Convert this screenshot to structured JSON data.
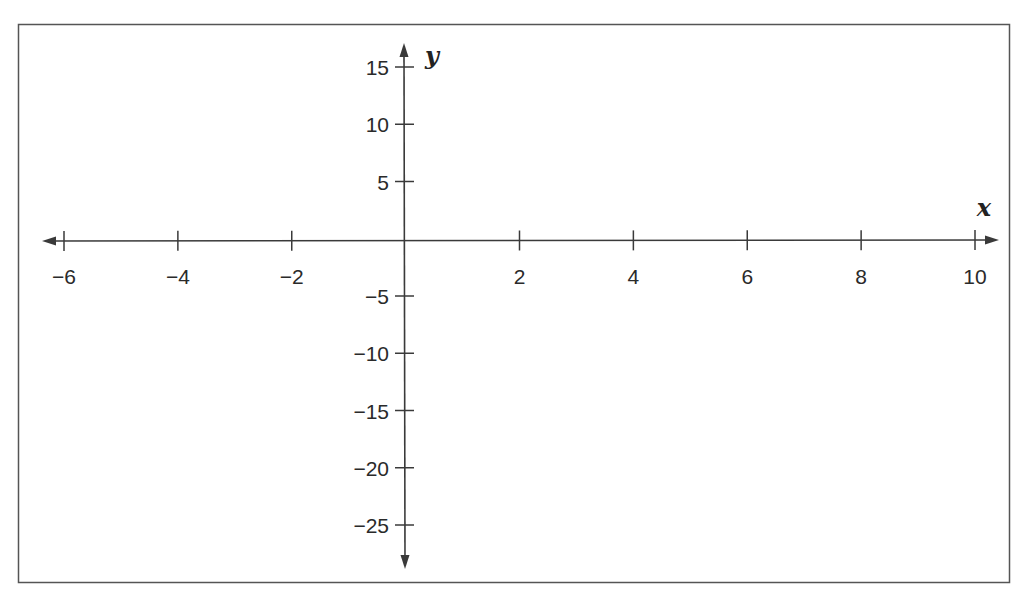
{
  "chart_data": {
    "type": "line",
    "title": "",
    "xlabel": "x",
    "ylabel": "y",
    "xlim": [
      -6,
      10
    ],
    "ylim": [
      -25,
      15
    ],
    "grid": false,
    "legend": null,
    "x_ticks": [
      -6,
      -4,
      -2,
      2,
      4,
      6,
      8,
      10
    ],
    "x_tick_labels": [
      "−6",
      "−4",
      "−2",
      "2",
      "4",
      "6",
      "8",
      "10"
    ],
    "y_ticks": [
      15,
      10,
      5,
      -5,
      -10,
      -15,
      -20,
      -25
    ],
    "y_tick_labels": [
      "15",
      "10",
      "5",
      "−5",
      "−10",
      "−15",
      "−20",
      "−25"
    ],
    "series": []
  },
  "colors": {
    "axis": "#3a3a3a",
    "frame": "#555555",
    "text": "#2a2a2a",
    "background": "#ffffff"
  }
}
